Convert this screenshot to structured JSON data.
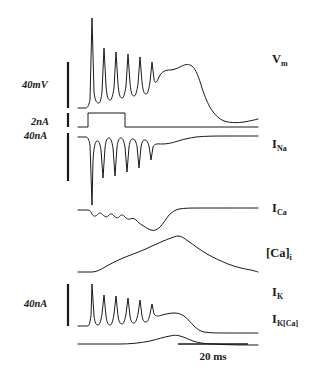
{
  "figure": {
    "type": "electrophysiology-traces",
    "background_color": "#ffffff",
    "trace_color": "#1a1a1a"
  },
  "scale_bars": {
    "vertical": [
      {
        "id": "vm-scale",
        "label": "40mV",
        "label_x": 22,
        "label_y": 88,
        "bar_x": 68,
        "bar_y1": 62,
        "bar_y2": 108,
        "stroke_width": 2.2
      },
      {
        "id": "istim-scale",
        "label": "2nA",
        "label_x": 31,
        "label_y": 125,
        "bar_x": 68,
        "bar_y1": 113,
        "bar_y2": 127,
        "stroke_width": 2.2
      },
      {
        "id": "ina-scale",
        "label": "40nA",
        "label_x": 24,
        "label_y": 139,
        "bar_x": 68,
        "bar_y1": 133,
        "bar_y2": 181,
        "stroke_width": 2.2
      },
      {
        "id": "ik-scale",
        "label": "40nA",
        "label_x": 24,
        "label_y": 307,
        "bar_x": 68,
        "bar_y1": 284,
        "bar_y2": 326,
        "stroke_width": 2.2
      }
    ],
    "horizontal": {
      "id": "time-scale",
      "label": "20 ms",
      "label_x": 213,
      "label_y": 360,
      "bar_x1": 178,
      "bar_x2": 248,
      "bar_y": 344,
      "stroke_width": 1.6
    }
  },
  "trace_labels": [
    {
      "id": "vm-label",
      "base": "V",
      "sub": "m",
      "x": 272,
      "y": 63
    },
    {
      "id": "ina-label",
      "base": "I",
      "sub": "Na",
      "x": 272,
      "y": 148
    },
    {
      "id": "ica-label",
      "base": "I",
      "sub": "Ca",
      "x": 272,
      "y": 212
    },
    {
      "id": "cai-label",
      "base": "[Ca]",
      "sub": "i",
      "x": 266,
      "y": 257
    },
    {
      "id": "ik-label",
      "base": "I",
      "sub": "K",
      "x": 272,
      "y": 296
    },
    {
      "id": "ikca-label",
      "base": "I",
      "sub": "K[Ca]",
      "x": 272,
      "y": 323
    }
  ],
  "chart_data": {
    "type": "line",
    "title": "",
    "xlabel": "time",
    "ylabel": "",
    "grid": false,
    "legend": "right-of-trace",
    "x_scale_bar_ms": 20,
    "time_axis": {
      "trace_start_px": 78,
      "trace_end_px": 258,
      "stimulus_on_px": 88,
      "stimulus_off_px": 125
    },
    "series": [
      {
        "name": "V_m",
        "label": "V_m",
        "unit": "mV",
        "scale_bar": "40mV",
        "baseline_y": 108,
        "path": "M 78,108 L 86,108 C 88,108 89,104 90,100 L 92,18 L 94,92 C 95,100 96,102 98,103 C 100,104 101,100 102,92 L 104,48 L 106,86 C 107,97 108,100 110,100 C 112,100 113,94 114,88 L 116,52 L 118,84 C 119,95 120,98 122,98 C 124,98 125,92 126,86 L 128,54 L 130,83 C 131,93 132,96 134,96 C 136,96 137,90 138,84 L 140,57 L 142,82 C 143,91 144,94 146,94 C 148,94 149,88 150,82 L 152,62 L 154,79 C 155,85 157,82 159,77 C 162,71 166,70 170,70 C 174,70 178,68 182,66 C 186,64 189,64 192,66 C 196,69 199,78 202,88 C 205,97 208,104 211,109 C 215,115 219,119 224,121 C 230,123 237,123 244,122 C 250,121 254,120 258,119"
      },
      {
        "name": "I_stim",
        "label": "injected current step",
        "unit": "nA",
        "amplitude": 2,
        "scale_bar": "2nA",
        "baseline_y": 127,
        "path": "M 78,127 L 88,127 L 88,113 L 125,113 L 125,127 L 258,127"
      },
      {
        "name": "I_Na",
        "label": "I_Na",
        "unit": "nA",
        "scale_bar": "40nA",
        "baseline_y": 137,
        "path": "M 78,137 L 86,137 C 88,137 89,140 90,145 L 92,205 L 93,160 C 94,146 95,142 97,141 C 99,140 100,144 101,150 L 103,178 L 105,148 C 106,140 107,138 109,138 C 111,138 112,142 113,148 L 115,176 L 117,147 C 118,140 119,138 121,138 C 123,138 124,142 125,147 L 127,172 L 129,147 C 130,140 131,139 133,139 C 135,139 136,142 137,146 L 139,168 L 141,147 C 142,141 143,140 145,140 C 147,140 148,143 149,146 L 151,160 L 153,147 C 155,143 158,144 162,144 C 167,144 172,143 178,141 C 184,139 190,138 196,137 C 206,136 216,136 226,136 C 238,136 248,136 258,136"
      },
      {
        "name": "I_Ca",
        "label": "I_Ca",
        "unit": "nA",
        "baseline_y": 210,
        "path": "M 78,210 L 88,210 C 90,210 91,212 92,214 C 93,216 95,217 97,215 C 99,213 100,212 102,214 C 104,216 106,218 108,216 C 110,214 111,213 113,215 C 115,217 117,219 119,217 C 121,215 122,214 124,216 C 126,218 128,220 130,219 C 132,218 134,218 136,220 C 138,222 140,224 142,225 C 145,227 148,229 151,230 C 154,231 157,230 160,227 C 163,224 166,219 169,215 C 172,212 175,210 179,209 C 185,208 192,208 200,208 C 215,208 235,208 258,208"
      },
      {
        "name": "[Ca]_i",
        "label": "[Ca]_i",
        "unit": "relative",
        "baseline_y": 272,
        "path": "M 78,272 L 92,272 C 96,272 100,270 105,267 C 112,263 120,259 128,256 C 136,253 144,250 152,246 C 159,243 165,240 171,238 C 174,237 176,236 178,236 C 181,236 184,238 188,241 C 194,245 200,250 207,254 C 214,258 221,261 228,264 C 236,267 244,269 251,270 C 254,271 256,271 258,272"
      },
      {
        "name": "I_K",
        "label": "I_K",
        "unit": "nA",
        "scale_bar": "40nA",
        "baseline_y": 326,
        "path": "M 78,326 L 88,326 C 89,326 90,322 91,316 L 92,284 L 94,316 C 95,323 96,325 98,325 C 100,325 101,320 102,314 L 104,295 L 106,316 C 107,323 108,325 110,325 C 112,325 113,320 114,314 L 116,296 L 118,316 C 119,322 120,324 122,324 C 124,324 125,319 126,314 L 128,298 L 130,316 C 131,322 132,323 134,323 C 136,323 137,318 138,314 L 140,300 L 142,316 C 143,321 144,322 146,322 C 148,322 149,318 150,314 L 152,304 L 154,314 C 156,317 159,316 162,315 C 166,314 170,313 174,313 C 178,313 181,314 184,316 C 188,319 191,323 194,326 C 197,329 200,331 204,332 C 210,333 218,333 226,333 C 238,333 248,333 258,333"
      },
      {
        "name": "I_K[Ca]",
        "label": "I_K[Ca]",
        "unit": "nA",
        "baseline_y": 344,
        "path": "M 78,344 L 120,344 C 130,344 140,343 150,341 C 158,339 164,337 170,336 C 174,335 177,335 180,336 C 184,337 188,339 193,341 C 199,343 206,344 214,344 C 228,345 243,345 258,345"
      }
    ]
  }
}
